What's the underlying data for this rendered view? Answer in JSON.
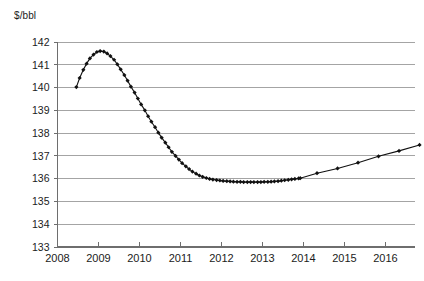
{
  "chart_data": {
    "type": "line",
    "title": "",
    "subtitle": "",
    "xlabel": "",
    "ylabel": "$/bbl",
    "unit_label": "$/bbl",
    "xlim": [
      2008.0,
      2016.9
    ],
    "ylim": [
      133,
      142
    ],
    "ytick_step": 1,
    "grid": "horizontal",
    "legend": "none",
    "marker": "diamond",
    "line_color": "#111111",
    "marker_color": "#111111",
    "grid_color": "#9a9a9a",
    "axis_color": "#6e6e6e",
    "background": "#ffffff",
    "ytick_labels": [
      "142",
      "141",
      "140",
      "139",
      "138",
      "137",
      "136",
      "135",
      "134",
      "133"
    ],
    "ytick_values": [
      142,
      141,
      140,
      139,
      138,
      137,
      136,
      135,
      134,
      133
    ],
    "xtick_labels": [
      "2008",
      "2009",
      "2010",
      "2011",
      "2012",
      "2013",
      "2014",
      "2015",
      "2016"
    ],
    "xtick_values": [
      2008,
      2009,
      2010,
      2011,
      2012,
      2013,
      2014,
      2015,
      2016
    ],
    "series": [
      {
        "name": "Oil price",
        "marker_density_note": "monthly markers through 2013.92, quarterly thereafter",
        "x": [
          2008.46,
          2008.54,
          2008.63,
          2008.71,
          2008.79,
          2008.88,
          2008.96,
          2009.04,
          2009.13,
          2009.21,
          2009.29,
          2009.38,
          2009.46,
          2009.54,
          2009.63,
          2009.71,
          2009.79,
          2009.88,
          2009.96,
          2010.04,
          2010.13,
          2010.21,
          2010.29,
          2010.38,
          2010.46,
          2010.54,
          2010.63,
          2010.71,
          2010.79,
          2010.88,
          2010.96,
          2011.04,
          2011.13,
          2011.21,
          2011.29,
          2011.38,
          2011.46,
          2011.54,
          2011.63,
          2011.71,
          2011.79,
          2011.88,
          2011.96,
          2012.04,
          2012.13,
          2012.21,
          2012.29,
          2012.38,
          2012.46,
          2012.54,
          2012.63,
          2012.71,
          2012.79,
          2012.88,
          2012.96,
          2013.04,
          2013.13,
          2013.21,
          2013.29,
          2013.38,
          2013.46,
          2013.54,
          2013.63,
          2013.71,
          2013.79,
          2013.88,
          2013.92,
          2014.33,
          2014.83,
          2015.33,
          2015.83,
          2016.33,
          2016.83
        ],
        "y": [
          140.02,
          140.42,
          140.78,
          141.05,
          141.28,
          141.45,
          141.56,
          141.6,
          141.58,
          141.5,
          141.38,
          141.22,
          141.02,
          140.8,
          140.55,
          140.3,
          140.04,
          139.78,
          139.52,
          139.26,
          139.0,
          138.74,
          138.5,
          138.26,
          138.02,
          137.8,
          137.58,
          137.38,
          137.18,
          137.0,
          136.84,
          136.68,
          136.54,
          136.42,
          136.31,
          136.22,
          136.14,
          136.08,
          136.03,
          135.99,
          135.96,
          135.94,
          135.92,
          135.9,
          135.89,
          135.88,
          135.87,
          135.86,
          135.86,
          135.85,
          135.85,
          135.85,
          135.85,
          135.85,
          135.85,
          135.86,
          135.86,
          135.87,
          135.88,
          135.89,
          135.91,
          135.93,
          135.95,
          135.97,
          135.99,
          136.01,
          136.02,
          136.24,
          136.45,
          136.7,
          136.98,
          137.22,
          137.48
        ]
      }
    ]
  }
}
